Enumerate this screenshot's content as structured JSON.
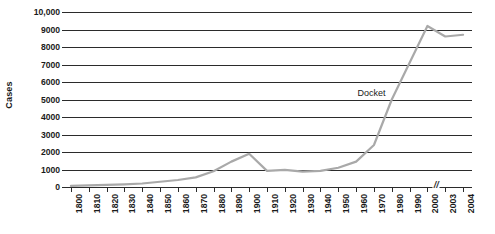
{
  "chart_data": {
    "type": "line",
    "title": "",
    "xlabel": "",
    "ylabel": "Cases",
    "ylim": [
      0,
      10000
    ],
    "yticks": [
      0,
      1000,
      2000,
      3000,
      4000,
      5000,
      6000,
      7000,
      8000,
      9000,
      10000
    ],
    "ytick_labels": [
      "0",
      "1000",
      "2000",
      "3000",
      "4000",
      "5000",
      "6000",
      "7000",
      "8000",
      "9000",
      "10,000"
    ],
    "grid": true,
    "legend_position": "inline-annotation",
    "axis_break": {
      "symbol": "//",
      "between": [
        "2000",
        "2003"
      ]
    },
    "categories": [
      "1800",
      "1810",
      "1820",
      "1830",
      "1840",
      "1850",
      "1860",
      "1870",
      "1880",
      "1890",
      "1900",
      "1910",
      "1920",
      "1930",
      "1940",
      "1950",
      "1960",
      "1970",
      "1980",
      "1990",
      "2000",
      "2003",
      "2004"
    ],
    "series": [
      {
        "name": "Docket",
        "color": "#a9a9a9",
        "values": [
          60,
          90,
          120,
          150,
          200,
          300,
          400,
          550,
          900,
          1450,
          1900,
          920,
          980,
          880,
          920,
          1100,
          1450,
          2400,
          5000,
          7100,
          9200,
          8600,
          8700
        ]
      }
    ],
    "annotations": [
      {
        "text": "Docket",
        "x_frac": 0.755,
        "y_value": 5350
      }
    ]
  },
  "axis": {
    "y_title": "Cases"
  }
}
